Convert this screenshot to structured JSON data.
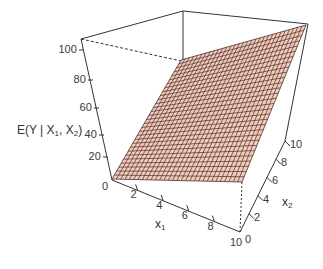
{
  "chart_data": {
    "type": "surface3d",
    "title": "",
    "zlabel": "E(Y | X1, X2)",
    "xlabel": "x1",
    "ylabel": "x2",
    "x_ticks": [
      "0",
      "2",
      "4",
      "6",
      "8",
      "10"
    ],
    "y_ticks": [
      "0",
      "2",
      "4",
      "6",
      "8",
      "10"
    ],
    "z_ticks": [
      "0",
      "20",
      "40",
      "60",
      "80",
      "100"
    ],
    "x_range": [
      0,
      10
    ],
    "y_range": [
      0,
      10
    ],
    "z_range": [
      0,
      100
    ],
    "surface": {
      "description": "planar surface E(Y|X1,X2) over grid",
      "corners": [
        {
          "x1": 0,
          "x2": 0,
          "z": 0
        },
        {
          "x1": 10,
          "x2": 0,
          "z": 10
        },
        {
          "x1": 10,
          "x2": 10,
          "z": 100
        },
        {
          "x1": 0,
          "x2": 10,
          "z": 80
        }
      ],
      "grid_lines": 30,
      "fill_color": "#f2cbbd",
      "line_color": "#4a2e28"
    },
    "box": true,
    "grid": false,
    "legend": null
  },
  "labels": {
    "z_axis_main": "E(Y | X",
    "z_axis_sub1": "1",
    "z_axis_mid": ", X",
    "z_axis_sub2": "2",
    "z_axis_end": ")",
    "x1_main": "x",
    "x1_sub": "1",
    "x2_main": "x",
    "x2_sub": "2"
  }
}
